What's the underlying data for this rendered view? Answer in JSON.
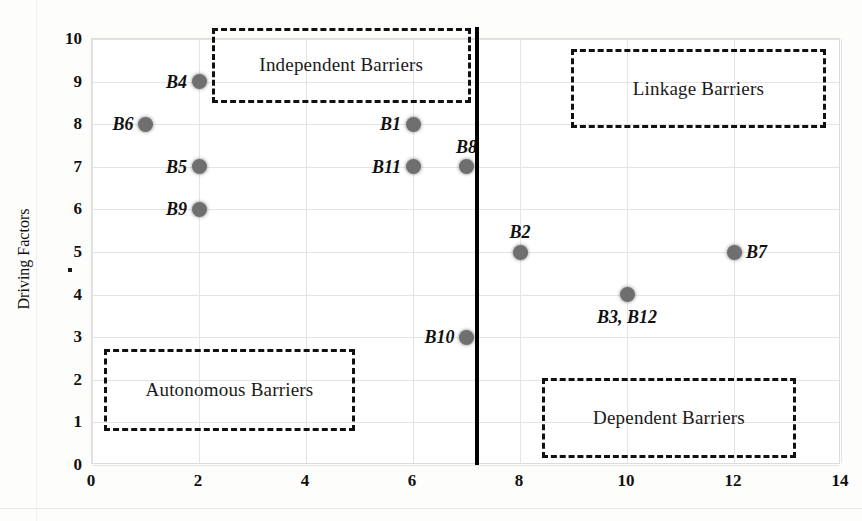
{
  "chart_data": {
    "type": "scatter",
    "title": "",
    "xlabel": "",
    "ylabel": "Driving Factors",
    "xlim": [
      0,
      14
    ],
    "ylim": [
      0,
      10
    ],
    "xticks": [
      0,
      2,
      4,
      6,
      8,
      10,
      12,
      14
    ],
    "yticks": [
      0,
      1,
      2,
      3,
      4,
      5,
      6,
      7,
      8,
      9,
      10
    ],
    "grid": true,
    "legend": "none",
    "points": [
      {
        "label": "B6",
        "x": 1,
        "y": 8,
        "label_pos": "left"
      },
      {
        "label": "B4",
        "x": 2,
        "y": 9,
        "label_pos": "left"
      },
      {
        "label": "B5",
        "x": 2,
        "y": 7,
        "label_pos": "left"
      },
      {
        "label": "B9",
        "x": 2,
        "y": 6,
        "label_pos": "left"
      },
      {
        "label": "B1",
        "x": 6,
        "y": 8,
        "label_pos": "left"
      },
      {
        "label": "B11",
        "x": 6,
        "y": 7,
        "label_pos": "left"
      },
      {
        "label": "B8",
        "x": 7,
        "y": 7,
        "label_pos": "above"
      },
      {
        "label": "B10",
        "x": 7,
        "y": 3,
        "label_pos": "left"
      },
      {
        "label": "B2",
        "x": 8,
        "y": 5,
        "label_pos": "above"
      },
      {
        "label": "B3, B12",
        "x": 10,
        "y": 4,
        "label_pos": "below"
      },
      {
        "label": "B7",
        "x": 12,
        "y": 5,
        "label_pos": "right"
      }
    ],
    "quadrant_divider": {
      "orientation": "vertical",
      "x": 7.2
    },
    "quadrant_labels": [
      {
        "name": "autonomous",
        "text": "Autonomous Barriers",
        "x0": 0.22,
        "y0": 0.8,
        "x1": 4.92,
        "y1": 2.72
      },
      {
        "name": "dependent",
        "text": "Dependent Barriers",
        "x0": 8.41,
        "y0": 0.16,
        "x1": 13.16,
        "y1": 2.04
      },
      {
        "name": "independent",
        "text": "Independent Barriers",
        "x0": 2.24,
        "y0": 8.5,
        "x1": 7.08,
        "y1": 10.26
      },
      {
        "name": "linkage",
        "text": "Linkage Barriers",
        "x0": 8.95,
        "y0": 7.91,
        "x1": 13.72,
        "y1": 9.76
      }
    ]
  },
  "axis": {
    "y_title": "Driving Factors",
    "y_tick_labels": [
      "10",
      "9",
      "8",
      "7",
      "6",
      "5",
      "4",
      "3",
      "2",
      "1",
      "0"
    ],
    "x_tick_labels": [
      "0",
      "2",
      "4",
      "6",
      "8",
      "10",
      "12",
      "14"
    ]
  },
  "colors": {
    "point_fill": "#6f6f6f",
    "divider": "#000000",
    "dashed_box": "#111111",
    "gridline": "#e4e4e4",
    "frame": "#dcdcdc",
    "text": "#111111",
    "background": "#ffffff"
  }
}
